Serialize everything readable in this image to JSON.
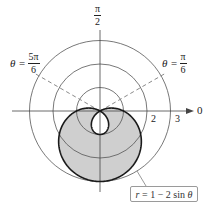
{
  "figure": {
    "type": "polar_graph",
    "curve_label": "r = 1 − 2 sin θ",
    "curve_label_parts": {
      "r": "r",
      "eq": " = 1 − 2 sin ",
      "theta": "θ"
    },
    "axis_labels": {
      "top": {
        "num": "π",
        "den": "2"
      },
      "right": "0"
    },
    "radial_ticks": [
      "2",
      "3"
    ],
    "rays": [
      {
        "prefix": "θ = ",
        "num": "5π",
        "den": "6",
        "angle_deg": 150
      },
      {
        "prefix": "θ = ",
        "num": "π",
        "den": "6",
        "angle_deg": 30
      }
    ],
    "grid_circles": [
      1,
      2,
      3
    ],
    "shaded_region": "area between outer and inner loop of limaçon",
    "colors": {
      "curve": "#1a1a1a",
      "grid": "#555555",
      "shade": "#cfcfcf",
      "ray": "#8a8a8a",
      "callout_border": "#9a9a9a"
    }
  }
}
